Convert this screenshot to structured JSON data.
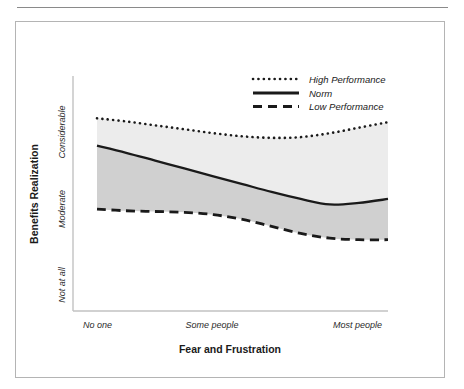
{
  "figure": {
    "border_color": "#b4b4b4",
    "rule_color": "#8a8a8a"
  },
  "chart_data": {
    "type": "line",
    "title": "",
    "subtitle": "",
    "xlabel": "Fear and Frustration",
    "ylabel": "Benefits Realization",
    "x_tick_labels": [
      "No one",
      "Some people",
      "Most people"
    ],
    "y_tick_labels": [
      "Not at all",
      "Moderate",
      "Considerable"
    ],
    "x": [
      0,
      0.1,
      0.2,
      0.3,
      0.4,
      0.5,
      0.6,
      0.7,
      0.8,
      0.9,
      1.0
    ],
    "xlim": [
      0,
      1
    ],
    "ylim": [
      0,
      3
    ],
    "grid": false,
    "legend_position": "top-right",
    "band_fills": [
      {
        "name": "high-to-norm",
        "color": "#ececec"
      },
      {
        "name": "norm-to-low",
        "color": "#d0d0d0"
      }
    ],
    "series": [
      {
        "name": "High Performance",
        "style": "dotted",
        "color": "#1a1a1a",
        "values": [
          2.46,
          2.42,
          2.37,
          2.32,
          2.27,
          2.23,
          2.21,
          2.22,
          2.27,
          2.34,
          2.41
        ]
      },
      {
        "name": "Norm",
        "style": "solid",
        "color": "#1a1a1a",
        "values": [
          2.11,
          2.02,
          1.92,
          1.82,
          1.72,
          1.62,
          1.52,
          1.43,
          1.36,
          1.38,
          1.43
        ]
      },
      {
        "name": "Low Performance",
        "style": "dashed",
        "color": "#1a1a1a",
        "values": [
          1.3,
          1.28,
          1.27,
          1.26,
          1.23,
          1.17,
          1.08,
          0.99,
          0.93,
          0.91,
          0.91
        ]
      }
    ],
    "legend_entries": [
      {
        "label": "High Performance",
        "style": "dotted"
      },
      {
        "label": "Norm",
        "style": "solid"
      },
      {
        "label": "Low Performance",
        "style": "dashed"
      }
    ]
  }
}
